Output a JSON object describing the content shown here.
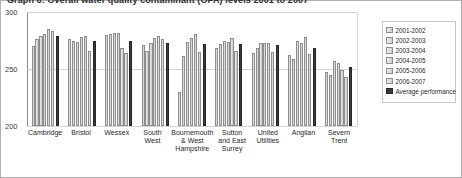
{
  "chart_data": {
    "type": "bar",
    "title": "Graph 6: Overall water quality contaminant (OPA) levels 2001 to 2007",
    "xlabel": "",
    "ylabel": "",
    "ylim": [
      200,
      300
    ],
    "yticks": [
      200,
      250,
      300
    ],
    "grid": true,
    "legend_position": "right",
    "categories": [
      "Cambridge",
      "Bristol",
      "Wessex",
      "South West",
      "Bournemouth & West Hampshire",
      "Sutton and East Surrey",
      "United Utilities",
      "Anglian",
      "Severn Trent"
    ],
    "series": [
      {
        "name": "2001-2002",
        "values": [
          270,
          276,
          280,
          271,
          230,
          268,
          264,
          262,
          247
        ]
      },
      {
        "name": "2002-2003",
        "values": [
          276,
          275,
          281,
          266,
          261,
          272,
          268,
          259,
          245
        ]
      },
      {
        "name": "2003-2004",
        "values": [
          279,
          274,
          282,
          273,
          274,
          275,
          273,
          275,
          257
        ]
      },
      {
        "name": "2004-2005",
        "values": [
          281,
          278,
          282,
          277,
          277,
          274,
          273,
          273,
          255
        ]
      },
      {
        "name": "2005-2006",
        "values": [
          285,
          279,
          268,
          279,
          281,
          277,
          273,
          278,
          249
        ]
      },
      {
        "name": "2006-2007",
        "values": [
          283,
          266,
          264,
          276,
          265,
          266,
          265,
          263,
          243
        ]
      }
    ],
    "average_series": {
      "name": "Average performance",
      "values": [
        279,
        275,
        275,
        273,
        272,
        272,
        271,
        268,
        252
      ]
    }
  },
  "legend": {
    "items": [
      {
        "label": "2001-2002",
        "style": "light"
      },
      {
        "label": "2002-2003",
        "style": "light"
      },
      {
        "label": "2003-2004",
        "style": "light"
      },
      {
        "label": "2004-2005",
        "style": "light"
      },
      {
        "label": "2005-2006",
        "style": "light"
      },
      {
        "label": "2006-2007",
        "style": "light"
      },
      {
        "label": "Average performance",
        "style": "dark"
      }
    ]
  },
  "colors": {
    "bar_light": "#dcdcdc",
    "bar_average": "#3a3a3a",
    "axis": "#8a8a8a",
    "grid": "#d5d5d5",
    "frame": "#b0b0b0"
  }
}
